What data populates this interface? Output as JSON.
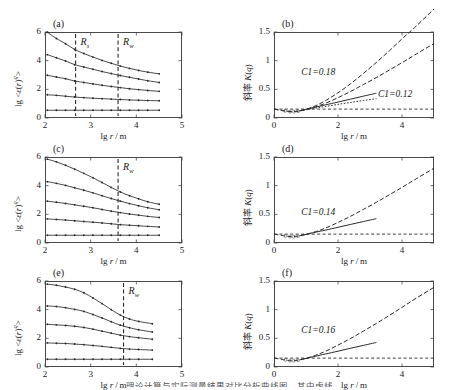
{
  "figure": {
    "caption_partial": "理论计算与实际测量结果对比分析曲线图，其中虚线",
    "xlabel": "lg r / m",
    "ylabel_left": "lg <ε(r)q>",
    "ylabel_right": "斜率 K(q)"
  },
  "panels": [
    {
      "id": "a",
      "label": "(a)",
      "column": "left",
      "xlabel": "lg r / m",
      "ylabel": "lg <ε(r)q>",
      "xticks": [
        "2",
        "3",
        "4",
        "5"
      ],
      "yticks": [
        "0",
        "2",
        "4",
        "6"
      ],
      "xlim": [
        2,
        5
      ],
      "ylim": [
        0,
        6
      ],
      "vlines": [
        {
          "label": "Rs",
          "x": 2.67
        },
        {
          "label": "Rw",
          "x": 3.6
        }
      ]
    },
    {
      "id": "b",
      "label": "(b)",
      "column": "right",
      "xlabel": "lg r / m",
      "ylabel": "斜率 K(q)",
      "xticks": [
        "0",
        "2",
        "4"
      ],
      "yticks": [
        "0",
        "0.5",
        "1",
        "1.5"
      ],
      "xlim": [
        0,
        5
      ],
      "ylim": [
        0,
        1.5
      ],
      "annotations": [
        {
          "text": "C1=0.18",
          "x": 0.85,
          "y": 0.78
        },
        {
          "text": "C1=0.12",
          "x": 3.25,
          "y": 0.4
        }
      ]
    },
    {
      "id": "c",
      "label": "(c)",
      "column": "left",
      "xlabel": "lg r / m",
      "ylabel": "lg <ε(r)q>",
      "xticks": [
        "2",
        "3",
        "4",
        "5"
      ],
      "yticks": [
        "0",
        "2",
        "4",
        "6"
      ],
      "xlim": [
        2,
        5
      ],
      "ylim": [
        0,
        6
      ],
      "vlines": [
        {
          "label": "Rw",
          "x": 3.6
        }
      ]
    },
    {
      "id": "d",
      "label": "(d)",
      "column": "right",
      "xlabel": "lg r / m",
      "ylabel": "斜率 K(q)",
      "xticks": [
        "0",
        "2",
        "4"
      ],
      "yticks": [
        "0",
        "0.5",
        "1",
        "1.5"
      ],
      "xlim": [
        0,
        5
      ],
      "ylim": [
        0,
        1.5
      ],
      "annotations": [
        {
          "text": "C1=0.14",
          "x": 0.85,
          "y": 0.52
        }
      ]
    },
    {
      "id": "e",
      "label": "(e)",
      "column": "left",
      "xlabel": "lg r / m",
      "ylabel": "lg <ε(r)q>",
      "xticks": [
        "2",
        "3",
        "4",
        "5"
      ],
      "yticks": [
        "0",
        "2",
        "4",
        "6"
      ],
      "xlim": [
        2,
        5
      ],
      "ylim": [
        0,
        6
      ],
      "vlines": [
        {
          "label": "Rw",
          "x": 3.72
        }
      ]
    },
    {
      "id": "f",
      "label": "(f)",
      "column": "right",
      "xlabel": "lg r / m",
      "ylabel": "斜率 K(q)",
      "xticks": [
        "0",
        "2",
        "4"
      ],
      "yticks": [
        "0",
        "0.5",
        "1",
        "1.5"
      ],
      "xlim": [
        0,
        5
      ],
      "ylim": [
        0,
        1.5
      ],
      "annotations": [
        {
          "text": "C1=0.16",
          "x": 0.85,
          "y": 0.62
        }
      ]
    }
  ],
  "chart_data": [
    {
      "type": "line",
      "panel": "a",
      "title": "(a)",
      "xlabel": "lg r / m",
      "ylabel": "lg <ε(r)q>",
      "xlim": [
        2,
        5
      ],
      "ylim": [
        0,
        6
      ],
      "xticks": [
        2,
        3,
        4,
        5
      ],
      "yticks": [
        0,
        2,
        4,
        6
      ],
      "grid": false,
      "legend": "none",
      "vlines": [
        {
          "label": "Rs",
          "x": 2.67,
          "style": "dashed"
        },
        {
          "label": "Rw",
          "x": 3.6,
          "style": "dashed"
        }
      ],
      "x": [
        2.05,
        2.25,
        2.45,
        2.65,
        2.85,
        3.05,
        3.25,
        3.45,
        3.65,
        3.85,
        4.05,
        4.25,
        4.5
      ],
      "series": [
        {
          "name": "q5",
          "values": [
            5.98,
            5.55,
            5.18,
            4.78,
            4.5,
            4.25,
            4.02,
            3.82,
            3.62,
            3.46,
            3.32,
            3.2,
            3.08
          ]
        },
        {
          "name": "q4",
          "values": [
            4.42,
            4.2,
            3.98,
            3.72,
            3.56,
            3.4,
            3.24,
            3.1,
            2.96,
            2.84,
            2.72,
            2.6,
            2.48
          ]
        },
        {
          "name": "q3",
          "values": [
            2.98,
            2.86,
            2.74,
            2.58,
            2.48,
            2.38,
            2.28,
            2.2,
            2.12,
            2.04,
            1.98,
            1.92,
            1.86
          ]
        },
        {
          "name": "q2",
          "values": [
            1.62,
            1.58,
            1.52,
            1.46,
            1.42,
            1.38,
            1.35,
            1.32,
            1.29,
            1.26,
            1.24,
            1.22,
            1.2
          ]
        },
        {
          "name": "q1",
          "values": [
            0.54,
            0.54,
            0.54,
            0.54,
            0.54,
            0.54,
            0.54,
            0.54,
            0.54,
            0.54,
            0.54,
            0.54,
            0.54
          ]
        }
      ]
    },
    {
      "type": "line",
      "panel": "b",
      "title": "(b)",
      "xlabel": "lg r / m",
      "ylabel": "斜率 K(q)",
      "xlim": [
        0,
        5
      ],
      "ylim": [
        0,
        1.5
      ],
      "xticks": [
        0,
        2,
        4
      ],
      "yticks": [
        0,
        0.5,
        1,
        1.5
      ],
      "grid": false,
      "legend": "none",
      "hline": {
        "y": 0.155,
        "style": "dashed"
      },
      "annotations": [
        "C1=0.18",
        "C1=0.12"
      ],
      "x": [
        0.0,
        0.3,
        0.55,
        0.8,
        1.0,
        1.3,
        1.6,
        2.0,
        2.4,
        2.8,
        3.2,
        3.6,
        4.0,
        4.4,
        5.0
      ],
      "series": [
        {
          "name": "curve-upper-C1-0.18",
          "values": [
            0.155,
            0.125,
            0.108,
            0.122,
            0.15,
            0.215,
            0.3,
            0.44,
            0.6,
            0.78,
            0.97,
            1.17,
            1.38,
            1.58,
            1.9
          ]
        },
        {
          "name": "curve-lower-C1-0.12",
          "values": [
            0.155,
            0.128,
            0.112,
            0.125,
            0.148,
            0.195,
            0.255,
            0.355,
            0.465,
            0.585,
            0.705,
            0.835,
            0.965,
            1.1,
            1.3
          ]
        },
        {
          "name": "tangent-short-solid",
          "values": [
            null,
            null,
            null,
            0.128,
            0.152,
            0.19,
            0.228,
            0.278,
            0.33,
            0.382,
            0.432,
            null,
            null,
            null,
            null
          ]
        },
        {
          "name": "tangent-short-dotted",
          "values": [
            null,
            null,
            null,
            0.126,
            0.145,
            0.173,
            0.2,
            0.238,
            0.272,
            0.305,
            0.338,
            null,
            null,
            null,
            null
          ]
        }
      ]
    },
    {
      "type": "line",
      "panel": "c",
      "title": "(c)",
      "xlabel": "lg r / m",
      "ylabel": "lg <ε(r)q>",
      "xlim": [
        2,
        5
      ],
      "ylim": [
        0,
        6
      ],
      "xticks": [
        2,
        3,
        4,
        5
      ],
      "yticks": [
        0,
        2,
        4,
        6
      ],
      "grid": false,
      "legend": "none",
      "vlines": [
        {
          "label": "Rw",
          "x": 3.6,
          "style": "dashed"
        }
      ],
      "x": [
        2.05,
        2.25,
        2.45,
        2.65,
        2.85,
        3.05,
        3.25,
        3.45,
        3.65,
        3.85,
        4.05,
        4.25,
        4.5
      ],
      "series": [
        {
          "name": "q5",
          "values": [
            5.85,
            5.66,
            5.42,
            5.15,
            4.86,
            4.55,
            4.22,
            3.88,
            3.56,
            3.3,
            3.08,
            2.88,
            2.7
          ]
        },
        {
          "name": "q4",
          "values": [
            4.28,
            4.16,
            4.02,
            3.85,
            3.68,
            3.5,
            3.3,
            3.1,
            2.92,
            2.75,
            2.6,
            2.46,
            2.32
          ]
        },
        {
          "name": "q3",
          "values": [
            2.92,
            2.84,
            2.76,
            2.66,
            2.56,
            2.46,
            2.34,
            2.22,
            2.12,
            2.02,
            1.94,
            1.86,
            1.78
          ]
        },
        {
          "name": "q2",
          "values": [
            1.68,
            1.64,
            1.6,
            1.55,
            1.5,
            1.45,
            1.4,
            1.34,
            1.28,
            1.24,
            1.2,
            1.16,
            1.12
          ]
        },
        {
          "name": "q1",
          "values": [
            0.54,
            0.54,
            0.54,
            0.54,
            0.54,
            0.54,
            0.54,
            0.54,
            0.54,
            0.54,
            0.54,
            0.54,
            0.54
          ]
        }
      ]
    },
    {
      "type": "line",
      "panel": "d",
      "title": "(d)",
      "xlabel": "lg r / m",
      "ylabel": "斜率 K(q)",
      "xlim": [
        0,
        5
      ],
      "ylim": [
        0,
        1.5
      ],
      "xticks": [
        0,
        2,
        4
      ],
      "yticks": [
        0,
        0.5,
        1,
        1.5
      ],
      "grid": false,
      "legend": "none",
      "hline": {
        "y": 0.155,
        "style": "dashed"
      },
      "annotations": [
        "C1=0.14"
      ],
      "x": [
        0.0,
        0.3,
        0.55,
        0.8,
        1.0,
        1.3,
        1.6,
        2.0,
        2.4,
        2.8,
        3.2,
        3.6,
        4.0,
        4.4,
        5.0
      ],
      "series": [
        {
          "name": "curve-main",
          "values": [
            0.155,
            0.128,
            0.11,
            0.125,
            0.15,
            0.198,
            0.258,
            0.358,
            0.468,
            0.588,
            0.71,
            0.84,
            0.97,
            1.105,
            1.305
          ]
        },
        {
          "name": "tangent-short",
          "values": [
            null,
            null,
            null,
            0.128,
            0.15,
            0.188,
            0.224,
            0.274,
            0.325,
            0.375,
            0.425,
            null,
            null,
            null,
            null
          ]
        }
      ]
    },
    {
      "type": "line",
      "panel": "e",
      "title": "(e)",
      "xlabel": "lg r / m",
      "ylabel": "lg <ε(r)q>",
      "xlim": [
        2,
        5
      ],
      "ylim": [
        0,
        6
      ],
      "xticks": [
        2,
        3,
        4,
        5
      ],
      "yticks": [
        0,
        2,
        4,
        6
      ],
      "grid": false,
      "legend": "none",
      "vlines": [
        {
          "label": "Rw",
          "x": 3.72,
          "style": "dashed"
        }
      ],
      "x": [
        2.05,
        2.25,
        2.45,
        2.65,
        2.85,
        3.05,
        3.25,
        3.45,
        3.65,
        3.85,
        4.05,
        4.35
      ],
      "series": [
        {
          "name": "q5",
          "values": [
            5.78,
            5.7,
            5.58,
            5.42,
            5.18,
            4.82,
            4.42,
            4.0,
            3.62,
            3.35,
            3.18,
            3.02
          ]
        },
        {
          "name": "q4",
          "values": [
            4.26,
            4.22,
            4.14,
            4.02,
            3.88,
            3.66,
            3.42,
            3.16,
            2.92,
            2.74,
            2.6,
            2.44
          ]
        },
        {
          "name": "q3",
          "values": [
            2.98,
            2.94,
            2.9,
            2.84,
            2.76,
            2.64,
            2.5,
            2.36,
            2.22,
            2.12,
            2.04,
            1.94
          ]
        },
        {
          "name": "q2",
          "values": [
            1.68,
            1.66,
            1.64,
            1.6,
            1.56,
            1.5,
            1.44,
            1.37,
            1.3,
            1.25,
            1.22,
            1.18
          ]
        },
        {
          "name": "q1",
          "values": [
            0.54,
            0.54,
            0.54,
            0.54,
            0.54,
            0.54,
            0.54,
            0.54,
            0.54,
            0.54,
            0.54,
            0.54
          ]
        }
      ]
    },
    {
      "type": "line",
      "panel": "f",
      "title": "(f)",
      "xlabel": "lg r / m",
      "ylabel": "斜率 K(q)",
      "xlim": [
        0,
        5
      ],
      "ylim": [
        0,
        1.5
      ],
      "xticks": [
        0,
        2,
        4
      ],
      "yticks": [
        0,
        0.5,
        1,
        1.5
      ],
      "grid": false,
      "legend": "none",
      "hline": {
        "y": 0.155,
        "style": "dashed"
      },
      "annotations": [
        "C1=0.16"
      ],
      "x": [
        0.0,
        0.3,
        0.55,
        0.8,
        1.0,
        1.3,
        1.6,
        2.0,
        2.4,
        2.8,
        3.2,
        3.6,
        4.0,
        4.4,
        5.0
      ],
      "series": [
        {
          "name": "curve-main",
          "values": [
            0.155,
            0.128,
            0.108,
            0.124,
            0.15,
            0.205,
            0.272,
            0.382,
            0.5,
            0.628,
            0.76,
            0.898,
            1.04,
            1.185,
            1.39
          ]
        },
        {
          "name": "tangent-short",
          "values": [
            null,
            null,
            null,
            0.128,
            0.15,
            0.188,
            0.226,
            0.276,
            0.328,
            0.378,
            0.428,
            null,
            null,
            null,
            null
          ]
        }
      ]
    }
  ]
}
